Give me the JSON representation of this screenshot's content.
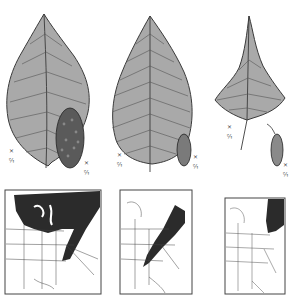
{
  "figure": {
    "specimens": [
      {
        "name": "specimen-1",
        "leaf_label": "½ ×",
        "catkin_label": "½ ×",
        "range_region": "northern-and-appalachian"
      },
      {
        "name": "specimen-2",
        "leaf_label": "½ ×",
        "catkin_label": "½ ×",
        "range_region": "appalachian-northeast"
      },
      {
        "name": "specimen-3",
        "leaf_label": "½ ×",
        "catkin_label": "½ ×",
        "range_region": "new-england"
      }
    ],
    "colors": {
      "leaf_fill": "#a9a9a9",
      "leaf_stroke": "#3a3a3a",
      "range_fill": "#2b2b2b",
      "map_line": "#444444",
      "background": "#ffffff"
    }
  }
}
